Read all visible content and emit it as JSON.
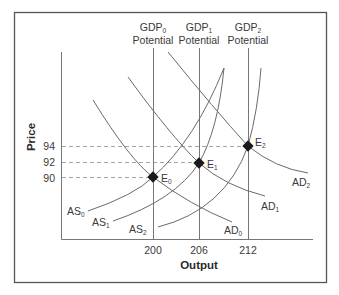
{
  "diagram": {
    "y_axis_title": "Price",
    "x_axis_title": "Output",
    "price_ticks": [
      {
        "label": "94",
        "y": 146
      },
      {
        "label": "92",
        "y": 162
      },
      {
        "label": "90",
        "y": 178
      }
    ],
    "output_ticks": [
      {
        "label": "200",
        "x": 153
      },
      {
        "label": "206",
        "x": 199
      },
      {
        "label": "212",
        "x": 248
      }
    ],
    "potential_lines": [
      {
        "base": "GDP",
        "sub": "0",
        "line2": "Potential",
        "x": 153
      },
      {
        "base": "GDP",
        "sub": "1",
        "line2": "Potential",
        "x": 199
      },
      {
        "base": "GDP",
        "sub": "2",
        "line2": "Potential",
        "x": 248
      }
    ],
    "aggregate_supply": [
      {
        "base": "AS",
        "sub": "0"
      },
      {
        "base": "AS",
        "sub": "1"
      },
      {
        "base": "AS",
        "sub": "2"
      }
    ],
    "aggregate_demand": [
      {
        "base": "AD",
        "sub": "0"
      },
      {
        "base": "AD",
        "sub": "1"
      },
      {
        "base": "AD",
        "sub": "2"
      }
    ],
    "equilibria": [
      {
        "base": "E",
        "sub": "0",
        "output": "200",
        "price": "90"
      },
      {
        "base": "E",
        "sub": "1",
        "output": "206",
        "price": "92"
      },
      {
        "base": "E",
        "sub": "2",
        "output": "212",
        "price": "94"
      }
    ],
    "colors": {
      "frame": "#555555",
      "curve": "#6a6a6a",
      "dashed": "#9a9a9a",
      "point": "#1a1a1a",
      "text": "#3a3a3a"
    }
  }
}
